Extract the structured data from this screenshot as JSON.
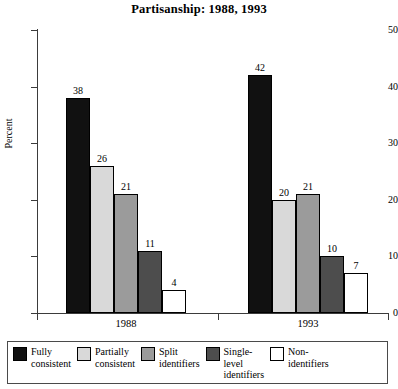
{
  "chart_data": {
    "type": "bar",
    "title": "Partisanship: 1988, 1993",
    "xlabel": "",
    "ylabel": "Percent",
    "ylim": [
      0,
      50
    ],
    "yticks": [
      0,
      10,
      20,
      30,
      40,
      50
    ],
    "grid": false,
    "legend_position": "bottom",
    "categories": [
      "1988",
      "1993"
    ],
    "series": [
      {
        "name": "Fully\nconsistent",
        "color": "#111111",
        "values": [
          38,
          42
        ]
      },
      {
        "name": "Partially\nconsistent",
        "color": "#d9d9d9",
        "values": [
          26,
          20
        ]
      },
      {
        "name": "Split\nidentifiers",
        "color": "#9b9b9b",
        "values": [
          21,
          21
        ]
      },
      {
        "name": "Single-\nlevel\nidentifiers",
        "color": "#4d4d4d",
        "values": [
          11,
          10
        ]
      },
      {
        "name": "Non-\nidentifiers",
        "color": "#ffffff",
        "values": [
          4,
          7
        ]
      }
    ]
  },
  "axis": {
    "y_tick_labels": [
      "0",
      "10",
      "20",
      "30",
      "40",
      "50"
    ],
    "y_title": "Percent",
    "x_group_labels": [
      "1988",
      "1993"
    ]
  },
  "legend": {
    "entries": [
      {
        "label": "Fully\nconsistent",
        "color": "#111111"
      },
      {
        "label": "Partially\nconsistent",
        "color": "#d9d9d9"
      },
      {
        "label": "Split\nidentifiers",
        "color": "#9b9b9b"
      },
      {
        "label": "Single-\nlevel\nidentifiers",
        "color": "#4d4d4d"
      },
      {
        "label": "Non-\nidentifiers",
        "color": "#ffffff"
      }
    ]
  },
  "values_flat": {
    "g1988": [
      "38",
      "26",
      "21",
      "11",
      "4"
    ],
    "g1993": [
      "42",
      "20",
      "21",
      "10",
      "7"
    ]
  }
}
